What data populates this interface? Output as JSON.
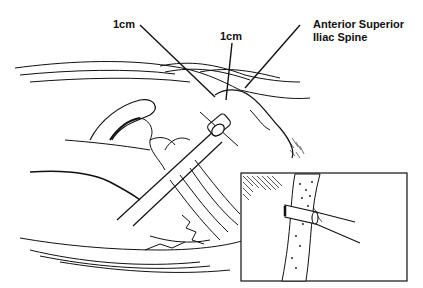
{
  "figure": {
    "labels": {
      "left_measure": "1cm",
      "center_measure": "1cm",
      "landmark_line1": "Anterior Superior",
      "landmark_line2": "Iliac Spine"
    },
    "inset": {
      "description": "Close-up of pin passing through cancellous bone of iliac crest"
    },
    "colors": {
      "ink": "#111111",
      "background": "#ffffff"
    }
  }
}
